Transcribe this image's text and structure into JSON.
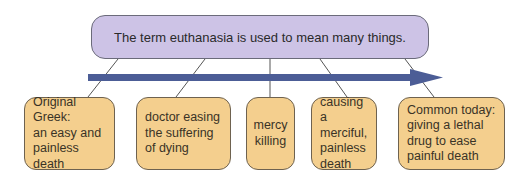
{
  "header": {
    "title": "The term euthanasia is used to mean many things."
  },
  "colors": {
    "top_box": "#cdc3e6",
    "boxes": "#f4cf8e",
    "arrow": "#4c5d96"
  },
  "boxes": [
    {
      "line1": "Original Greek:",
      "line2": "an easy and",
      "line3": "painless death",
      "line4": ""
    },
    {
      "line1": "doctor easing",
      "line2": "the suffering",
      "line3": "of dying",
      "line4": ""
    },
    {
      "line1": "mercy",
      "line2": "killing",
      "line3": "",
      "line4": ""
    },
    {
      "line1": "causing a",
      "line2": "merciful,",
      "line3": "painless",
      "line4": "death"
    },
    {
      "line1": "Common today:",
      "line2": "giving a lethal",
      "line3": "drug to ease",
      "line4": "painful death"
    }
  ]
}
